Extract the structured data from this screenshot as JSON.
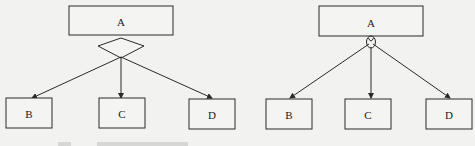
{
  "diagrams": [
    {
      "id": "left",
      "connector": "diamond",
      "parent": {
        "label": "A"
      },
      "children": [
        {
          "label": "B"
        },
        {
          "label": "C"
        },
        {
          "label": "D"
        }
      ]
    },
    {
      "id": "right",
      "connector": "circle-loop",
      "parent": {
        "label": "A"
      },
      "children": [
        {
          "label": "B"
        },
        {
          "label": "C"
        },
        {
          "label": "D"
        }
      ]
    }
  ],
  "caption": ""
}
